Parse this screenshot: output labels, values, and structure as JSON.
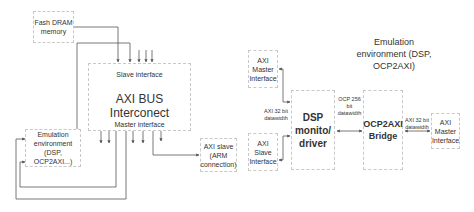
{
  "left_diagram": {
    "dram_box": "Fash DRAM memory",
    "interconnect": {
      "title": "AXI BUS Interconect",
      "slave_label": "Slave interface",
      "master_label": "Master interface"
    },
    "emulation_box": "Emulation environment (DSP, OCP2AXI...)",
    "axi_slave_box": "AXI slave (ARM connection)"
  },
  "right_diagram": {
    "title": "Emulation environment (DSP, OCP2AXI)",
    "axi_master_top": "AXI Master Interface",
    "axi_slave": "AXI Slave Interface",
    "axi_32_left": "AXI 32 bit datawidth",
    "dsp_box": "DSP monito/ driver",
    "ocp_label": "OCP 256 bit datawidth",
    "bridge_box": "OCP2AXI Bridge",
    "axi_32_right": "AXI 32 bit datawidth",
    "axi_master_right": "AXI Master Interface"
  },
  "colors": {
    "line": "#555555",
    "box_border": "#c8c8c8"
  }
}
